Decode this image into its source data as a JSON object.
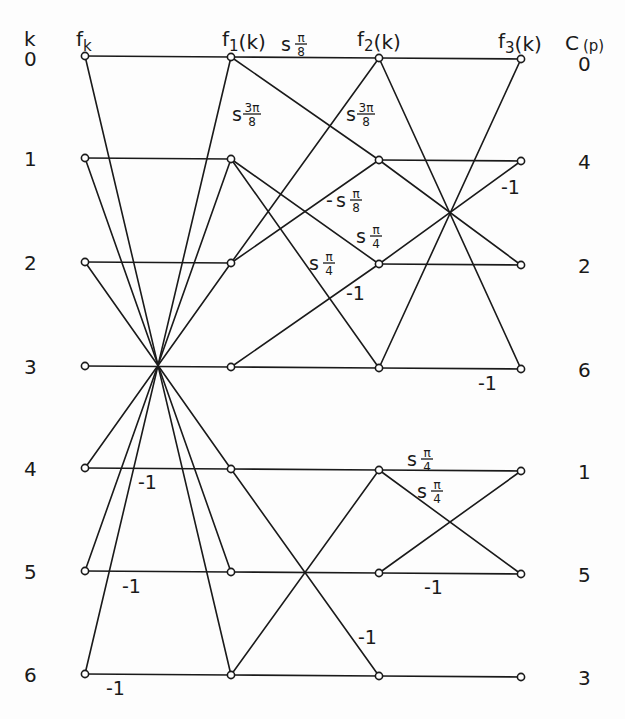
{
  "diagram": {
    "row_index_header": "k",
    "output_header": {
      "base": "C",
      "sub": "(p)"
    },
    "column_headers": [
      {
        "base": "f",
        "sub": "k",
        "suffix": ""
      },
      {
        "base": "f",
        "sub": "1",
        "suffix": "(k)"
      },
      {
        "base": "f",
        "sub": "2",
        "suffix": "(k)"
      },
      {
        "base": "f",
        "sub": "3",
        "suffix": "(k)"
      }
    ],
    "row_labels": [
      "0",
      "1",
      "2",
      "3",
      "4",
      "5",
      "6"
    ],
    "output_labels": [
      "0",
      "4",
      "2",
      "6",
      "1",
      "5",
      "3"
    ],
    "layout": {
      "col_x": [
        85,
        231,
        379,
        521
      ],
      "col_dy": [
        0,
        1,
        2,
        3
      ],
      "row_y": [
        56,
        158,
        262,
        366,
        468,
        571,
        674
      ],
      "header_positions": [
        {
          "x": 76,
          "y": 46
        },
        {
          "x": 222,
          "y": 46
        },
        {
          "x": 357,
          "y": 46
        },
        {
          "x": 498,
          "y": 48
        }
      ],
      "row_index_header_pos": {
        "x": 24,
        "y": 46
      },
      "output_header_pos": {
        "x": 565,
        "y": 50
      },
      "row_label_x": 24,
      "output_label_x": 578
    },
    "edges": [
      [
        0,
        0,
        1,
        0
      ],
      [
        0,
        1,
        1,
        1
      ],
      [
        0,
        2,
        1,
        2
      ],
      [
        0,
        3,
        1,
        3
      ],
      [
        0,
        4,
        1,
        4
      ],
      [
        0,
        5,
        1,
        5
      ],
      [
        0,
        6,
        1,
        6
      ],
      [
        0,
        0,
        1,
        6
      ],
      [
        0,
        1,
        1,
        5
      ],
      [
        0,
        2,
        1,
        4
      ],
      [
        0,
        6,
        1,
        0
      ],
      [
        0,
        5,
        1,
        1
      ],
      [
        0,
        4,
        1,
        2
      ],
      [
        1,
        0,
        2,
        0
      ],
      [
        1,
        0,
        2,
        1
      ],
      [
        1,
        2,
        2,
        0
      ],
      [
        1,
        2,
        2,
        1
      ],
      [
        1,
        1,
        2,
        2
      ],
      [
        1,
        1,
        2,
        3
      ],
      [
        1,
        3,
        2,
        2
      ],
      [
        1,
        3,
        2,
        3
      ],
      [
        1,
        4,
        2,
        4
      ],
      [
        1,
        4,
        2,
        6
      ],
      [
        1,
        5,
        2,
        5
      ],
      [
        1,
        6,
        2,
        4
      ],
      [
        1,
        6,
        2,
        6
      ],
      [
        2,
        0,
        3,
        0
      ],
      [
        2,
        0,
        3,
        3
      ],
      [
        2,
        3,
        3,
        0
      ],
      [
        2,
        3,
        3,
        3
      ],
      [
        2,
        1,
        3,
        1
      ],
      [
        2,
        1,
        3,
        2
      ],
      [
        2,
        2,
        3,
        1
      ],
      [
        2,
        2,
        3,
        2
      ],
      [
        2,
        4,
        3,
        4
      ],
      [
        2,
        4,
        3,
        5
      ],
      [
        2,
        5,
        3,
        4
      ],
      [
        2,
        5,
        3,
        5
      ],
      [
        2,
        6,
        3,
        6
      ]
    ],
    "edge_labels": [
      {
        "type": "twiddle",
        "sign": "",
        "base": "s",
        "num": "π",
        "den": "8",
        "x": 281,
        "y": 51
      },
      {
        "type": "twiddle",
        "sign": "",
        "base": "s",
        "num": "3π",
        "den": "8",
        "x": 232,
        "y": 121
      },
      {
        "type": "twiddle",
        "sign": "",
        "base": "s",
        "num": "3π",
        "den": "8",
        "x": 346,
        "y": 121
      },
      {
        "type": "twiddle",
        "sign": "-",
        "base": "s",
        "num": "π",
        "den": "8",
        "x": 336,
        "y": 207
      },
      {
        "type": "twiddle",
        "sign": "",
        "base": "s",
        "num": "π",
        "den": "4",
        "x": 356,
        "y": 243
      },
      {
        "type": "twiddle",
        "sign": "",
        "base": "s",
        "num": "π",
        "den": "4",
        "x": 309,
        "y": 270
      },
      {
        "type": "text",
        "text": "-1",
        "x": 346,
        "y": 300
      },
      {
        "type": "text",
        "text": "-1",
        "x": 501,
        "y": 194
      },
      {
        "type": "text",
        "text": "-1",
        "x": 478,
        "y": 390
      },
      {
        "type": "text",
        "text": "-1",
        "x": 138,
        "y": 489
      },
      {
        "type": "text",
        "text": "-1",
        "x": 122,
        "y": 593
      },
      {
        "type": "text",
        "text": "-1",
        "x": 106,
        "y": 695
      },
      {
        "type": "twiddle",
        "sign": "",
        "base": "s",
        "num": "π",
        "den": "4",
        "x": 407,
        "y": 466
      },
      {
        "type": "twiddle",
        "sign": "",
        "base": "s",
        "num": "π",
        "den": "4",
        "x": 417,
        "y": 498
      },
      {
        "type": "text",
        "text": "-1",
        "x": 424,
        "y": 594
      },
      {
        "type": "text",
        "text": "-1",
        "x": 358,
        "y": 644
      }
    ]
  }
}
